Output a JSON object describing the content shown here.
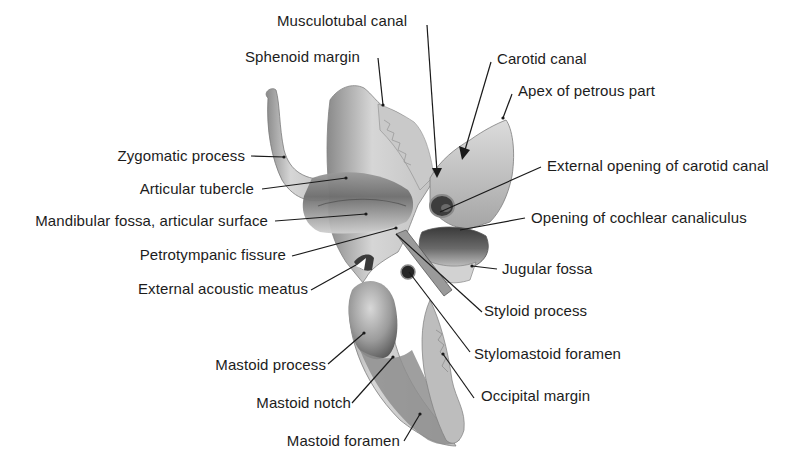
{
  "figure": {
    "labels": {
      "musculotubal_canal": "Musculotubal canal",
      "sphenoid_margin": "Sphenoid margin",
      "carotid_canal": "Carotid canal",
      "apex_petrous": "Apex of petrous part",
      "zygomatic_process": "Zygomatic process",
      "external_opening_carotid": "External opening of carotid canal",
      "articular_tubercle": "Articular tubercle",
      "mandibular_fossa": "Mandibular fossa, articular surface",
      "opening_cochlear": "Opening of cochlear canaliculus",
      "petrotympanic_fissure": "Petrotympanic fissure",
      "jugular_fossa": "Jugular fossa",
      "external_acoustic_meatus": "External acoustic meatus",
      "styloid_process": "Styloid process",
      "stylomastoid_foramen": "Stylomastoid foramen",
      "mastoid_process": "Mastoid process",
      "occipital_margin": "Occipital margin",
      "mastoid_notch": "Mastoid notch",
      "mastoid_foramen": "Mastoid foramen"
    },
    "colors": {
      "text": "#1c1c1c",
      "leader": "#1a1a1a",
      "bone_light": "#d9d9d9",
      "bone_mid": "#a8a8a8",
      "bone_dark": "#5e5e5e"
    }
  }
}
